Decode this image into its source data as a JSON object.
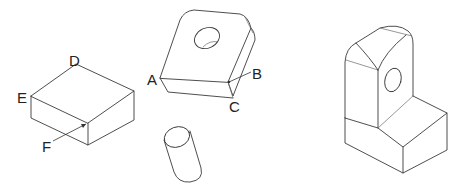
{
  "figure": {
    "objects": [
      {
        "id": "box",
        "description": "rectangular block",
        "labels": [
          "D",
          "E",
          "F"
        ]
      },
      {
        "id": "holed-block",
        "description": "block with through hole and rounded edges",
        "labels": [
          "A",
          "B",
          "C"
        ]
      },
      {
        "id": "cylinder",
        "description": "cylinder",
        "labels": []
      },
      {
        "id": "l-bracket",
        "description": "L-shaped bracket with hole in upright",
        "labels": []
      }
    ],
    "labels": {
      "D": "D",
      "E": "E",
      "F": "F",
      "A": "A",
      "B": "B",
      "C": "C"
    },
    "colors": {
      "stroke": "#3a3a3a",
      "background": "#ffffff",
      "text": "#222222"
    }
  }
}
